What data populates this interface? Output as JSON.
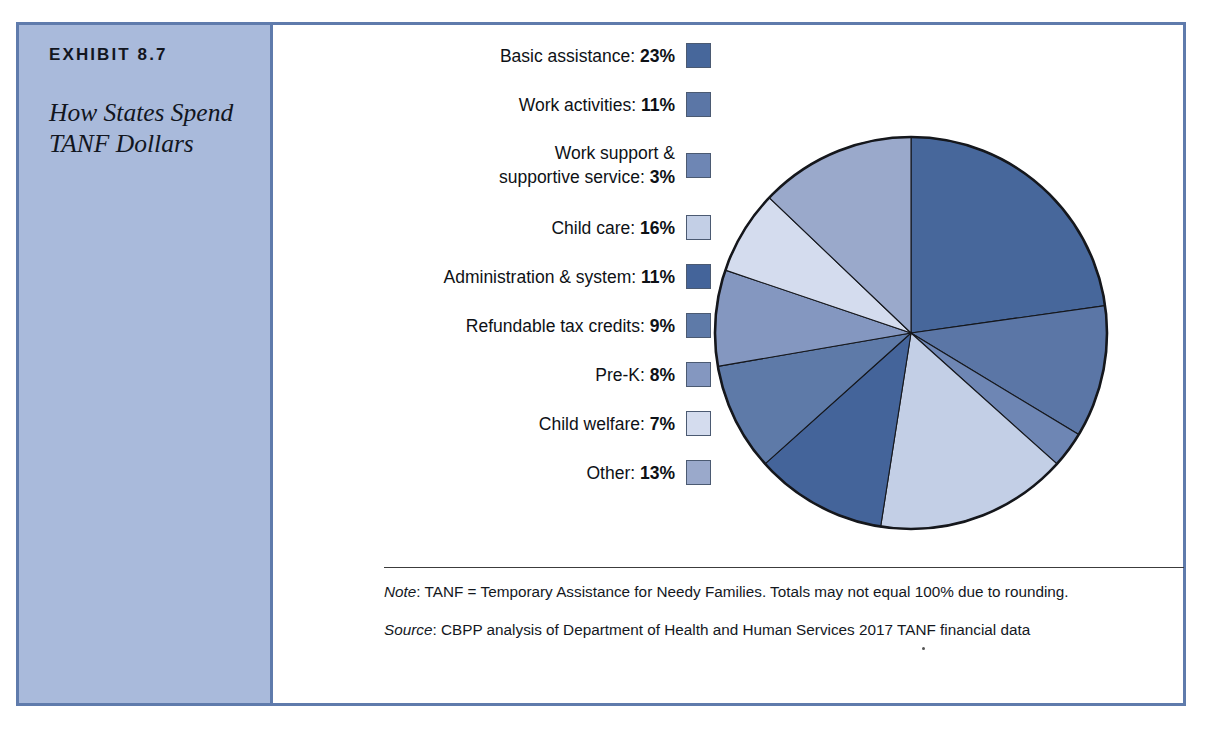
{
  "exhibit": {
    "number": "EXHIBIT 8.7",
    "title": "How States Spend TANF Dollars"
  },
  "colors": {
    "frame_border": "#5f7bac",
    "panel_fill": "#a9badb",
    "pie_outline": "#15171c"
  },
  "chart_data": {
    "type": "pie",
    "title": "How States Spend TANF Dollars",
    "unit": "percent",
    "start_angle_deg": 0,
    "direction": "clockwise",
    "legend_position": "left",
    "total": 101,
    "categories": [
      "Basic assistance",
      "Work activities",
      "Work support & supportive service",
      "Child care",
      "Administration & system",
      "Refundable tax credits",
      "Pre-K",
      "Child welfare",
      "Other"
    ],
    "values": [
      23,
      11,
      3,
      16,
      11,
      9,
      8,
      7,
      13
    ],
    "slice_colors": [
      "#47679b",
      "#5b76a6",
      "#6e86b4",
      "#c3cfe6",
      "#44649a",
      "#5e7aa8",
      "#8497c0",
      "#d4dcee",
      "#9aa9cb"
    ],
    "legend_entries": [
      {
        "label": "Basic assistance:",
        "value": "23%",
        "color": "#47679b",
        "lines": [
          "Basic assistance: 23%"
        ]
      },
      {
        "label": "Work activities:",
        "value": "11%",
        "color": "#5b76a6",
        "lines": [
          "Work activities: 11%"
        ]
      },
      {
        "label": "Work support & supportive service:",
        "value": "3%",
        "color": "#6e86b4",
        "lines": [
          "Work support &",
          "supportive service: 3%"
        ]
      },
      {
        "label": "Child care:",
        "value": "16%",
        "color": "#c3cfe6",
        "lines": [
          "Child care: 16%"
        ]
      },
      {
        "label": "Administration & system:",
        "value": "11%",
        "color": "#44649a",
        "lines": [
          "Administration & system: 11%"
        ]
      },
      {
        "label": "Refundable tax credits:",
        "value": "9%",
        "color": "#5e7aa8",
        "lines": [
          "Refundable tax credits: 9%"
        ]
      },
      {
        "label": "Pre-K:",
        "value": "8%",
        "color": "#8497c0",
        "lines": [
          "Pre-K: 8%"
        ]
      },
      {
        "label": "Child welfare:",
        "value": "7%",
        "color": "#d4dcee",
        "lines": [
          "Child welfare: 7%"
        ]
      },
      {
        "label": "Other:",
        "value": "13%",
        "color": "#9aa9cb",
        "lines": [
          "Other: 13%"
        ]
      }
    ]
  },
  "notes": {
    "note_prefix": "Note",
    "note_text": ": TANF = Temporary Assistance for Needy Families. Totals may not equal 100% due to rounding.",
    "source_prefix": "Source",
    "source_text": ": CBPP analysis of Department of Health and Human Services 2017 TANF financial data"
  }
}
